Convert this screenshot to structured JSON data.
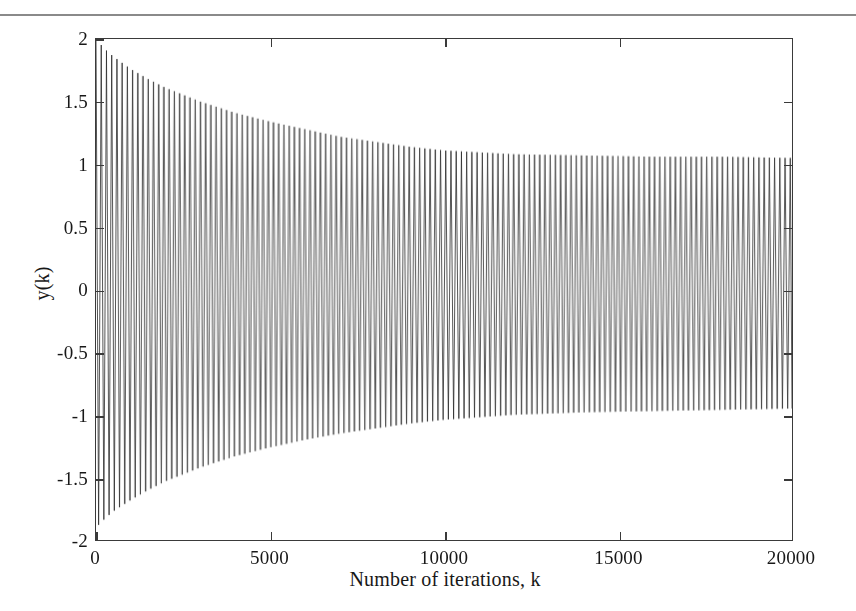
{
  "figure": {
    "background_color": "#ffffff",
    "ink_color": "#2b2b2b",
    "frame_color": "#3a3a3a",
    "page_rule": true
  },
  "chart_data": {
    "type": "line",
    "title": "",
    "subtitle": "",
    "xlabel": "Number of iterations, k",
    "ylabel": "y(k)",
    "xlim": [
      0,
      20000
    ],
    "ylim": [
      -2,
      2
    ],
    "xticks": [
      0,
      5000,
      10000,
      15000,
      20000
    ],
    "xticklabels": [
      "0",
      "5000",
      "10000",
      "15000",
      "20000"
    ],
    "yticks": [
      -2,
      -1.5,
      -1,
      -0.5,
      0,
      0.5,
      1,
      1.5,
      2
    ],
    "yticklabels": [
      "-2",
      "-1.5",
      "-1",
      "-0.5",
      "0",
      "0.5",
      "1",
      "1.5",
      "2"
    ],
    "grid": false,
    "legend": null,
    "annotations": [],
    "series": [
      {
        "name": "y(k)",
        "color": "#2b2b2b",
        "linewidth": 0.8,
        "oscillation_period_k": 150,
        "envelope_upper": {
          "k": [
            0,
            250,
            500,
            1000,
            1500,
            2000,
            3000,
            4000,
            5000,
            6000,
            7000,
            8000,
            9000,
            10000,
            12000,
            14000,
            16000,
            18000,
            20000
          ],
          "value": [
            2.0,
            1.92,
            1.86,
            1.76,
            1.68,
            1.61,
            1.5,
            1.41,
            1.34,
            1.28,
            1.22,
            1.18,
            1.14,
            1.11,
            1.08,
            1.07,
            1.06,
            1.06,
            1.05
          ]
        },
        "envelope_lower": {
          "k": [
            0,
            250,
            500,
            1000,
            1500,
            2000,
            3000,
            4000,
            5000,
            6000,
            7000,
            8000,
            9000,
            10000,
            12000,
            14000,
            16000,
            18000,
            20000
          ],
          "value": [
            -1.9,
            -1.83,
            -1.77,
            -1.68,
            -1.6,
            -1.53,
            -1.42,
            -1.33,
            -1.26,
            -1.2,
            -1.15,
            -1.11,
            -1.07,
            -1.04,
            -1.0,
            -0.98,
            -0.97,
            -0.96,
            -0.95
          ]
        },
        "steady_state_upper": 1.05,
        "steady_state_lower": -0.95,
        "initial_upper": 2.0,
        "initial_lower": -1.9
      }
    ]
  },
  "axis_title_x": "Number of iterations, k",
  "axis_title_y": "y(k)"
}
